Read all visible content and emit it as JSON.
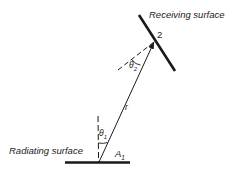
{
  "labels": {
    "receiving_surface": "Receiving surface",
    "radiating_surface": "Radiating surface",
    "point_2": "2",
    "area_a1": "A",
    "area_a1_sub": "1",
    "distance_r": "r",
    "theta1": "θ",
    "theta1_sub": "1",
    "theta2": "θ",
    "theta2_sub": "2"
  },
  "colors": {
    "ink": "#1a1a1a",
    "background": "#ffffff"
  }
}
